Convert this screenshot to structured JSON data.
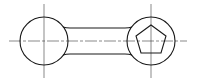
{
  "drawing": {
    "type": "technical-drawing",
    "description": "Connecting link with two circular bosses; right boss contains a pentagonal hole",
    "colors": {
      "outline": "#1a1a1a",
      "centerline": "#3a3a3a",
      "background": "#ffffff"
    },
    "left_boss": {
      "shape": "circle",
      "center": [
        44,
        41
      ],
      "radius": 24
    },
    "right_boss": {
      "shape": "circle",
      "center": [
        151,
        41
      ],
      "radius": 24
    },
    "bar": {
      "top_y": 28,
      "bottom_y": 54,
      "x_start": 66,
      "x_end": 129
    },
    "pentagon": {
      "shape": "regular-pentagon",
      "center": [
        151,
        41
      ],
      "vertices": [
        [
          151,
          25
        ],
        [
          166,
          36
        ],
        [
          161,
          53
        ],
        [
          141,
          53
        ],
        [
          136,
          36
        ]
      ]
    },
    "centerlines": {
      "horizontal": {
        "y": 41,
        "x_start": 9,
        "x_end": 187
      },
      "left_vertical": {
        "x": 44,
        "y_start": 4,
        "y_end": 78
      },
      "right_vertical": {
        "x": 151,
        "y_start": 4,
        "y_end": 78
      }
    }
  }
}
